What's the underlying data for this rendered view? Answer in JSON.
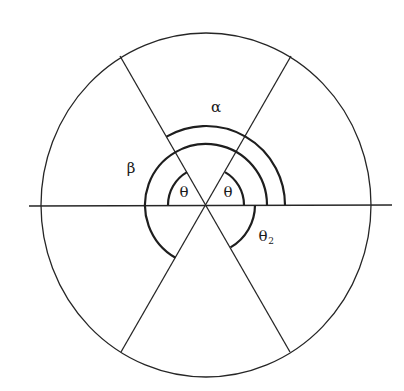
{
  "diagram": {
    "type": "geometry",
    "labels": {
      "alpha": "α",
      "beta": "β",
      "theta_left": "θ",
      "theta_right": "θ",
      "theta2_main": "θ",
      "theta2_sub": "2"
    },
    "geometry": {
      "center": [
        206,
        205
      ],
      "circle_rx": 165,
      "circle_ry": 172,
      "horizontal_line_x": [
        29,
        392
      ],
      "diagonal_angles_deg": [
        60,
        120
      ],
      "arcs": [
        {
          "name": "theta-right-arc",
          "radius": 38,
          "from_deg": 0,
          "to_deg": 60
        },
        {
          "name": "theta-left-arc",
          "radius": 38,
          "from_deg": 120,
          "to_deg": 180
        },
        {
          "name": "beta-arc",
          "radius": 61,
          "from_deg": 0,
          "to_deg": 240
        },
        {
          "name": "alpha-arc",
          "radius": 79,
          "from_deg": 0,
          "to_deg": 120
        },
        {
          "name": "theta2-arc",
          "radius": 49,
          "from_deg": 0,
          "to_deg": -60
        }
      ]
    },
    "colors": {
      "stroke": "#222222",
      "background": "#ffffff"
    }
  }
}
